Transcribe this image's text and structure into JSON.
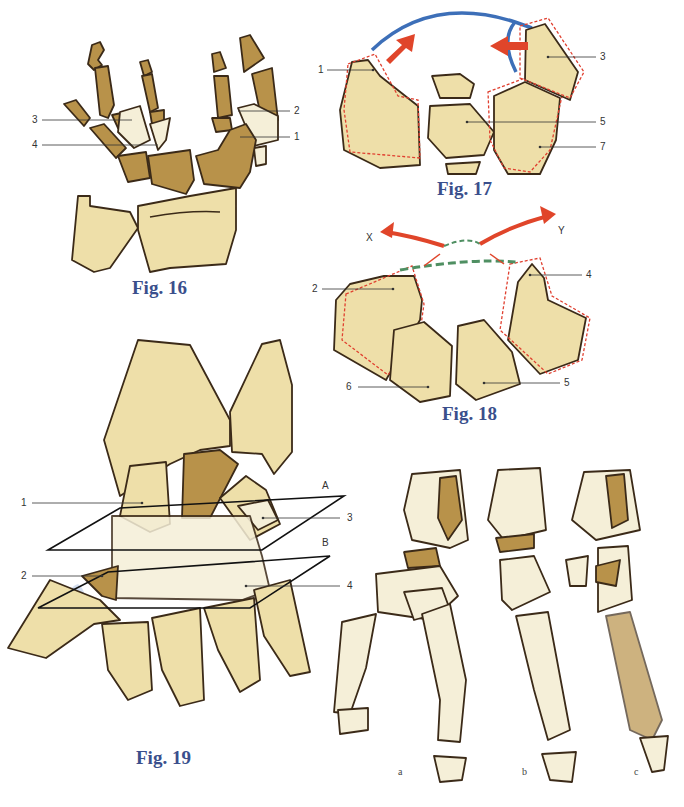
{
  "figures": {
    "fig16": {
      "caption": "Fig. 16",
      "labels": [
        "1",
        "2",
        "3",
        "4"
      ]
    },
    "fig17": {
      "caption": "Fig. 17",
      "labels": [
        "1",
        "3",
        "5",
        "7"
      ]
    },
    "fig18": {
      "caption": "Fig. 18",
      "labels": [
        "2",
        "4",
        "5",
        "6"
      ],
      "arrows": [
        "X",
        "Y"
      ]
    },
    "fig19": {
      "caption": "Fig. 19",
      "labels": [
        "1",
        "2",
        "3",
        "4"
      ],
      "planes": [
        "A",
        "B"
      ]
    },
    "fig20": {
      "sublabels": [
        "a",
        "b",
        "c"
      ]
    }
  },
  "colors": {
    "bone_light": "#eedfa9",
    "bone_pale": "#f5efd8",
    "bone_dark": "#b8924a",
    "outline": "#3b2a18",
    "arrow_red": "#e0452a",
    "blue_line": "#3d6fb8",
    "green_dash": "#4f8f62",
    "dotted_red": "#e04030",
    "caption_blue": "#3a4f8c"
  }
}
